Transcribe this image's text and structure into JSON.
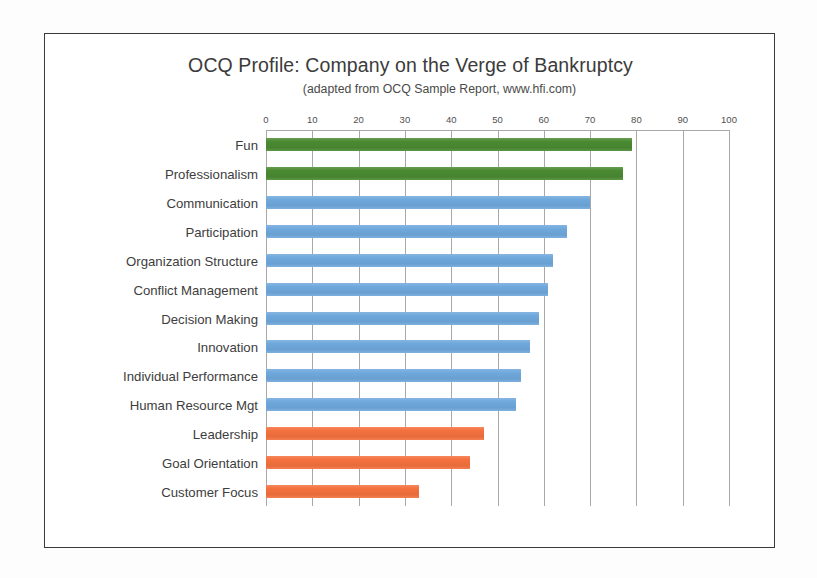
{
  "chart_data": {
    "type": "bar",
    "orientation": "horizontal",
    "title": "OCQ Profile: Company on the Verge of Bankruptcy",
    "subtitle": "(adapted from OCQ Sample Report, www.hfi.com)",
    "xlabel": "",
    "ylabel": "",
    "xlim": [
      0,
      100
    ],
    "xticks": [
      0,
      10,
      20,
      30,
      40,
      50,
      60,
      70,
      80,
      90,
      100
    ],
    "xtick_labels": [
      "0",
      "10",
      "20",
      "30",
      "40",
      "50",
      "60",
      "70",
      "80",
      "90",
      "100"
    ],
    "grid": "vertical",
    "legend": "none",
    "categories": [
      "Fun",
      "Professionalism",
      "Communication",
      "Participation",
      "Organization Structure",
      "Conflict Management",
      "Decision Making",
      "Innovation",
      "Individual Performance",
      "Human Resource Mgt",
      "Leadership",
      "Goal Orientation",
      "Customer Focus"
    ],
    "values": [
      79,
      77,
      70,
      65,
      62,
      61,
      59,
      57,
      55,
      54,
      47,
      44,
      33
    ],
    "bar_colors": [
      "#4a8a32",
      "#4a8a32",
      "#6fa8dc",
      "#6fa8dc",
      "#6fa8dc",
      "#6fa8dc",
      "#6fa8dc",
      "#6fa8dc",
      "#6fa8dc",
      "#6fa8dc",
      "#f4713e",
      "#f4713e",
      "#f4713e"
    ],
    "color_groups": {
      "green": "#4a8a32",
      "blue": "#6fa8dc",
      "orange": "#f4713e"
    }
  }
}
